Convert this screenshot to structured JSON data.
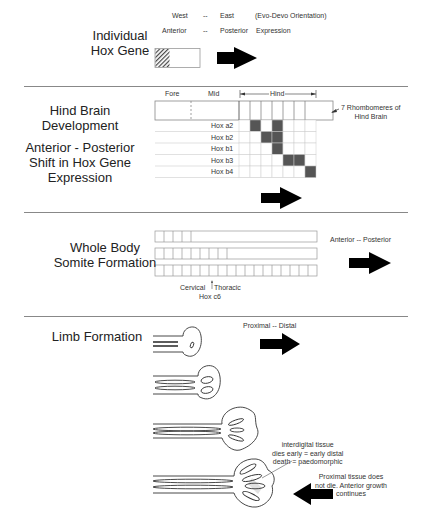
{
  "section1": {
    "title_line1": "Individual",
    "title_line2": "Hox Gene",
    "orient_west": "West",
    "orient_dash1": "--",
    "orient_east": "East",
    "orient_note": "(Evo-Devo Orientation)",
    "expr_anterior": "Anterior",
    "expr_dash": "--",
    "expr_posterior": "Posterior",
    "expr_label": "Expression"
  },
  "section2": {
    "title_a_line1": "Hind Brain",
    "title_a_line2": "Development",
    "title_b_line1": "Anterior - Posterior",
    "title_b_line2": "Shift in Hox Gene",
    "title_b_line3": "Expression",
    "label_fore": "Fore",
    "label_mid": "Mid",
    "label_hind": "Hind",
    "rhombomere_note_line1": "7 Rhombomeres of",
    "rhombomere_note_line2": "Hind Brain",
    "genes": [
      {
        "name": "Hox a2",
        "filled": [
          2,
          4
        ]
      },
      {
        "name": "Hox b2",
        "filled": [
          3,
          4
        ]
      },
      {
        "name": "Hox b1",
        "filled": [
          4
        ]
      },
      {
        "name": "Hox b3",
        "filled": [
          5,
          6
        ]
      },
      {
        "name": "Hox b4",
        "filled": [
          7
        ]
      }
    ],
    "rhombomere_count": 7
  },
  "section3": {
    "title_line1": "Whole Body",
    "title_line2": "Somite Formation",
    "rows_somite_counts": [
      4,
      8,
      18
    ],
    "label_cervical": "Cervical",
    "label_thoracic": "Thoracic",
    "label_hox": "Hox c6",
    "axis_label": "Anterior  --  Posterior"
  },
  "section4": {
    "title": "Limb Formation",
    "axis_label": "Proximal  --  Distal",
    "note1_line1": "interdigital tissue",
    "note1_line2": "dies early = early distal",
    "note1_line3": "death = paedomorphic",
    "note2_line1": "Proximal tissue does",
    "note2_line2": "not die. Anterior growth",
    "note2_line3": "continues"
  },
  "colors": {
    "fill": "#555555",
    "arrow": "#000000",
    "line": "#888888"
  }
}
